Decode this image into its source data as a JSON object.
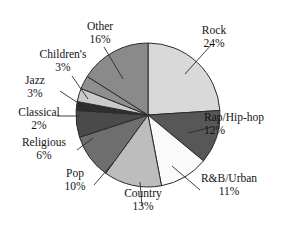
{
  "chart_data": {
    "type": "pie",
    "title": "",
    "subtitle": "",
    "xlabel": "",
    "ylabel": "",
    "legend_position": "none",
    "grid": false,
    "value_unit": "percent",
    "start_angle_deg": 0,
    "direction": "clockwise",
    "categories": [
      "Rock",
      "Rap/Hip-hop",
      "R&B/Urban",
      "Country",
      "Pop",
      "Religious",
      "Classical",
      "Jazz",
      "Children's",
      "Other"
    ],
    "values": [
      24,
      12,
      11,
      13,
      10,
      6,
      2,
      3,
      3,
      16
    ],
    "slices": [
      {
        "label": "Rock",
        "value": 24,
        "value_text": "24%",
        "color": "#d9d9d9"
      },
      {
        "label": "Rap/Hip-hop",
        "value": 12,
        "value_text": "12%",
        "color": "#575757"
      },
      {
        "label": "R&B/Urban",
        "value": 11,
        "value_text": "11%",
        "color": "#fafafa"
      },
      {
        "label": "Country",
        "value": 13,
        "value_text": "13%",
        "color": "#bdbdbd"
      },
      {
        "label": "Pop",
        "value": 10,
        "value_text": "10%",
        "color": "#6e6e6e"
      },
      {
        "label": "Religious",
        "value": 6,
        "value_text": "6%",
        "color": "#4a4a4a"
      },
      {
        "label": "Classical",
        "value": 2,
        "value_text": "2%",
        "color": "#2e2e2e"
      },
      {
        "label": "Jazz",
        "value": 3,
        "value_text": "3%",
        "color": "#cacaca"
      },
      {
        "label": "Children's",
        "value": 3,
        "value_text": "3%",
        "color": "#8f8f8f"
      },
      {
        "label": "Other",
        "value": 16,
        "value_text": "16%",
        "color": "#8a8a8a"
      }
    ],
    "total": 100,
    "colors": {
      "outline": "#2b2b2b",
      "background": "#ffffff",
      "text": "#141414"
    }
  },
  "labels": {
    "rock": {
      "name": "Rock",
      "pct": "24%"
    },
    "rap": {
      "name": "Rap/Hip-hop",
      "pct": "12%"
    },
    "rnb": {
      "name": "R&B/Urban",
      "pct": "11%"
    },
    "country": {
      "name": "Country",
      "pct": "13%"
    },
    "pop": {
      "name": "Pop",
      "pct": "10%"
    },
    "religious": {
      "name": "Religious",
      "pct": "6%"
    },
    "classical": {
      "name": "Classical",
      "pct": "2%"
    },
    "jazz": {
      "name": "Jazz",
      "pct": "3%"
    },
    "childrens": {
      "name": "Children's",
      "pct": "3%"
    },
    "other": {
      "name": "Other",
      "pct": "16%"
    }
  }
}
